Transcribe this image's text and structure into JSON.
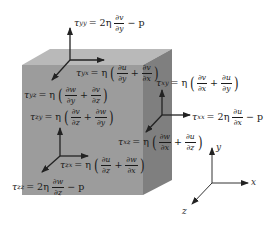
{
  "diagram": {
    "colors": {
      "cube_front": "#9a9a9a",
      "cube_top": "#b8b8b8",
      "cube_right": "#7e7e7e",
      "arrow": "#222222",
      "text": "#1a1a1a"
    },
    "equations": {
      "tau_yy": {
        "symbol": "τ",
        "sub": "yy",
        "rhs_prefix": "= 2η",
        "num": "∂v",
        "den": "∂y",
        "suffix": "− p"
      },
      "tau_yx": {
        "symbol": "τ",
        "sub": "yx",
        "rhs_prefix": "= η",
        "num1": "∂u",
        "den1": "∂y",
        "num2": "∂v",
        "den2": "∂x"
      },
      "tau_yz": {
        "symbol": "τ",
        "sub": "yz",
        "rhs_prefix": "= η",
        "num1": "∂w",
        "den1": "∂y",
        "num2": "∂v",
        "den2": "∂z"
      },
      "tau_xy": {
        "symbol": "τ",
        "sub": "xy",
        "rhs_prefix": "= η",
        "num1": "∂v",
        "den1": "∂x",
        "num2": "∂u",
        "den2": "∂y"
      },
      "tau_zy": {
        "symbol": "τ",
        "sub": "zy",
        "rhs_prefix": "= η",
        "num1": "∂v",
        "den1": "∂z",
        "num2": "∂w",
        "den2": "∂y"
      },
      "tau_xx": {
        "symbol": "τ",
        "sub": "xx",
        "rhs_prefix": "= 2η",
        "num": "∂u",
        "den": "∂x",
        "suffix": "− p"
      },
      "tau_xz": {
        "symbol": "τ",
        "sub": "xz",
        "rhs_prefix": "= η",
        "num1": "∂w",
        "den1": "∂x",
        "num2": "∂u",
        "den2": "∂z"
      },
      "tau_zx": {
        "symbol": "τ",
        "sub": "zx",
        "rhs_prefix": "= η",
        "num1": "∂u",
        "den1": "∂z",
        "num2": "∂w",
        "den2": "∂x"
      },
      "tau_zz": {
        "symbol": "τ",
        "sub": "zz",
        "rhs_prefix": "= 2η",
        "num": "∂w",
        "den": "∂z",
        "suffix": "− p"
      }
    },
    "axes": {
      "x": "x",
      "y": "y",
      "z": "z"
    },
    "op_plus": "+",
    "lparen": "(",
    "rparen": ")"
  }
}
